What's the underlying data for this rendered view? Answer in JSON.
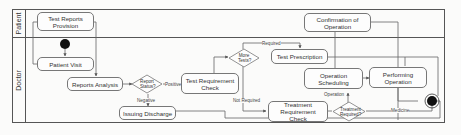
{
  "diagram": {
    "type": "swimlane activity diagram",
    "lanes": [
      {
        "id": "patient",
        "label": "Patient"
      },
      {
        "id": "doctor",
        "label": "Doctor"
      }
    ],
    "nodes": {
      "test_reports_provision": "Test Reports Provision",
      "patient_visit": "Patient Visit",
      "reports_analysis": "Reports Analysis",
      "report_status": "Report Status?",
      "test_requirement_check": "Test Requirement Check",
      "more_tests": "More Tests?",
      "test_prescription": "Test Prescription",
      "confirmation_of_operation": "Confirmation of Operation",
      "operation_scheduling": "Operation Scheduling",
      "performing_operation": "Performing Operation",
      "treatment_requirement_check": "Treatment Requirement Check",
      "treatment_required": "Treatment Required?",
      "issuing_discharge": "Issuing Discharge"
    },
    "edge_labels": {
      "positive": "Positive",
      "negative": "Negative",
      "required": "Required",
      "not_required": "Not Required",
      "operation": "Operation",
      "medicine": "Medicine"
    }
  }
}
